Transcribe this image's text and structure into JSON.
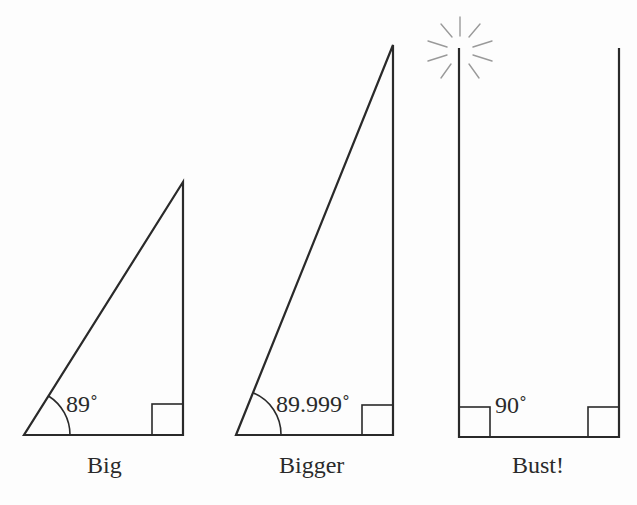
{
  "figures": [
    {
      "caption": "Big",
      "angle_label": "89˚",
      "angle_degrees": 89
    },
    {
      "caption": "Bigger",
      "angle_label": "89.999˚",
      "angle_degrees": 89.999
    },
    {
      "caption": "Bust!",
      "angle_label": "90˚",
      "angle_degrees": 90
    }
  ],
  "colors": {
    "stroke": "#2a2a2a",
    "burst": "#9a9a9a",
    "background": "#fdfdfd"
  }
}
